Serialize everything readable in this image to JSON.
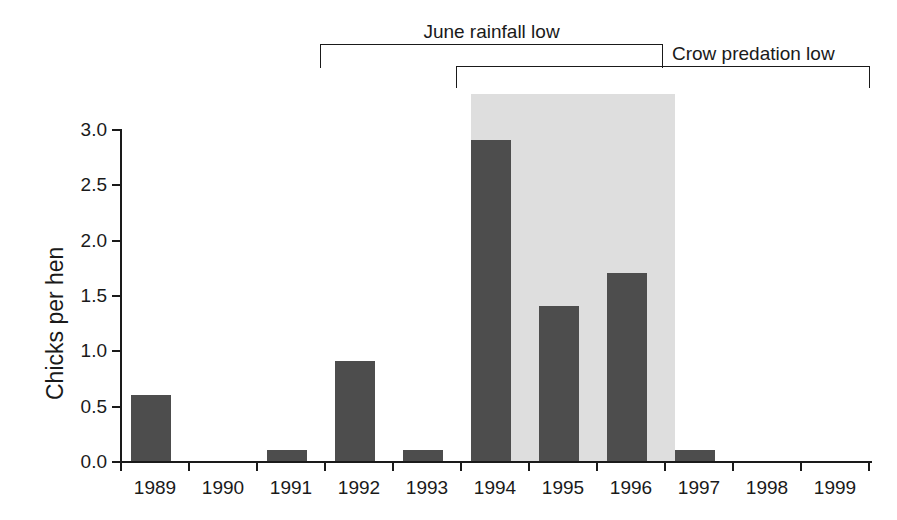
{
  "chart_data": {
    "type": "bar",
    "title": "",
    "xlabel": "",
    "ylabel": "Chicks per hen",
    "categories": [
      "1989",
      "1990",
      "1991",
      "1992",
      "1993",
      "1994",
      "1995",
      "1996",
      "1997",
      "1998",
      "1999"
    ],
    "values": [
      0.6,
      0.0,
      0.1,
      0.9,
      0.1,
      2.9,
      1.4,
      1.7,
      0.1,
      0.0,
      0.0
    ],
    "ylim": [
      0.0,
      3.0
    ],
    "ytick_labels": [
      "0.0",
      "0.5",
      "1.0",
      "1.5",
      "2.0",
      "2.5",
      "3.0"
    ],
    "ytick_values": [
      0.0,
      0.5,
      1.0,
      1.5,
      2.0,
      2.5,
      3.0
    ],
    "grid": false,
    "legend": false,
    "bar_color": "#4d4d4d",
    "shaded_region": {
      "label": "",
      "color": "#dedede",
      "from_category": "1994",
      "to_category": "1996"
    },
    "annotations": [
      {
        "label": "June rainfall low",
        "from_category": "1992",
        "to_category": "1996",
        "type": "bracket"
      },
      {
        "label": "Crow predation low",
        "from_category": "1994",
        "to_category": "1999",
        "type": "bracket"
      }
    ]
  },
  "axis": {
    "y_title": "Chicks per hen",
    "y_ticks": [
      "3.0",
      "2.5",
      "2.0",
      "1.5",
      "1.0",
      "0.5",
      "0.0"
    ],
    "x_ticks": [
      "1989",
      "1990",
      "1991",
      "1992",
      "1993",
      "1994",
      "1995",
      "1996",
      "1997",
      "1998",
      "1999"
    ]
  },
  "annotations": {
    "rainfall_label": "June rainfall low",
    "predation_label": "Crow predation low"
  }
}
